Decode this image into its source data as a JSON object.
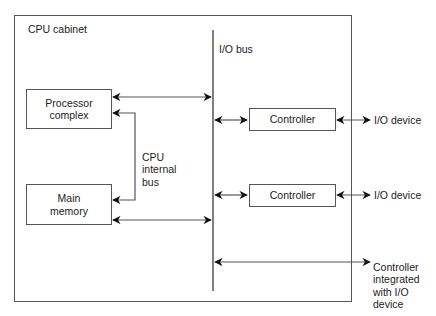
{
  "diagram": {
    "type": "block-diagram",
    "title": "",
    "cabinet": {
      "label": "CPU cabinet"
    },
    "bus": {
      "io_bus_label": "I/O bus",
      "cpu_internal_bus_label": "CPU\ninternal\nbus"
    },
    "blocks": {
      "processor": "Processor\ncomplex",
      "memory": "Main\nmemory",
      "controller_1": "Controller",
      "controller_2": "Controller"
    },
    "external": {
      "device_1": "I/O device",
      "device_2": "I/O device",
      "integrated": "Controller\nintegrated\nwith I/O\ndevice"
    },
    "colors": {
      "line": "#555555",
      "arrowhead": "#111111",
      "text": "#222222",
      "background": "#ffffff"
    },
    "connections": [
      {
        "from": "Processor complex",
        "to": "I/O bus",
        "type": "bidirectional"
      },
      {
        "from": "Processor complex",
        "to": "Main memory",
        "via": "CPU internal bus",
        "type": "bidirectional"
      },
      {
        "from": "Main memory",
        "to": "I/O bus",
        "type": "bidirectional"
      },
      {
        "from": "I/O bus",
        "to": "Controller 1",
        "type": "bidirectional"
      },
      {
        "from": "Controller 1",
        "to": "I/O device 1",
        "type": "bidirectional"
      },
      {
        "from": "I/O bus",
        "to": "Controller 2",
        "type": "bidirectional"
      },
      {
        "from": "Controller 2",
        "to": "I/O device 2",
        "type": "bidirectional"
      },
      {
        "from": "I/O bus",
        "to": "Controller integrated with I/O device",
        "type": "bidirectional"
      }
    ]
  }
}
